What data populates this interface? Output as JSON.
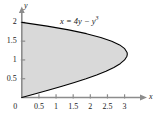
{
  "chart_data": {
    "type": "area",
    "title": "",
    "subtitle": "",
    "xlabel": "x",
    "ylabel": "y",
    "equation_label": "x = 4y − y",
    "equation_exponent": "3",
    "equation_plain": "x = 4y - y^3",
    "xlim": [
      0,
      3.45
    ],
    "ylim": [
      0,
      2.25
    ],
    "grid": false,
    "legend": false,
    "fill_color": "#d9d9d9",
    "curve_color": "#000000",
    "axis_color": "#808080",
    "text_color": "#1a1a1a",
    "x_ticks": [
      0,
      0.5,
      1,
      1.5,
      2,
      2.5,
      3
    ],
    "x_tick_labels": [
      "0",
      "0.5",
      "1",
      "1.5",
      "2",
      "2.5",
      "3"
    ],
    "y_ticks": [
      0.5,
      1,
      1.5,
      2
    ],
    "y_tick_labels": [
      "0.5",
      "1",
      "1.5",
      "2"
    ],
    "origin_label": "0",
    "curve_points": [
      {
        "y": 0.0,
        "x": 0.0
      },
      {
        "y": 0.1,
        "x": 0.399
      },
      {
        "y": 0.2,
        "x": 0.792
      },
      {
        "y": 0.3,
        "x": 1.173
      },
      {
        "y": 0.4,
        "x": 1.536
      },
      {
        "y": 0.5,
        "x": 1.875
      },
      {
        "y": 0.6,
        "x": 2.184
      },
      {
        "y": 0.7,
        "x": 2.457
      },
      {
        "y": 0.8,
        "x": 2.688
      },
      {
        "y": 0.9,
        "x": 2.871
      },
      {
        "y": 1.0,
        "x": 3.0
      },
      {
        "y": 1.1,
        "x": 3.069
      },
      {
        "y": 1.1547,
        "x": 3.0792
      },
      {
        "y": 1.2,
        "x": 3.072
      },
      {
        "y": 1.3,
        "x": 3.003
      },
      {
        "y": 1.4,
        "x": 2.856
      },
      {
        "y": 1.5,
        "x": 2.625
      },
      {
        "y": 1.6,
        "x": 2.304
      },
      {
        "y": 1.7,
        "x": 1.887
      },
      {
        "y": 1.8,
        "x": 1.368
      },
      {
        "y": 1.9,
        "x": 0.741
      },
      {
        "y": 2.0,
        "x": 0.0
      }
    ],
    "annotations": {
      "vertex": {
        "x": 3.0792,
        "y": 1.1547
      },
      "y_intercepts": [
        0,
        2
      ]
    }
  }
}
